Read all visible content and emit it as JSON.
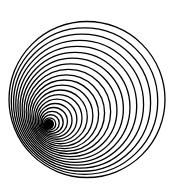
{
  "image": {
    "description": "Concentric-style nested circles forming an off-center tunnel optical illusion",
    "background": "#ffffff",
    "stroke": "#000000",
    "ring_count": 22,
    "outer": {
      "cx": 87,
      "cy": 99.5,
      "r": 78
    },
    "inner": {
      "cx": 48,
      "cy": 125,
      "r": 3
    }
  }
}
